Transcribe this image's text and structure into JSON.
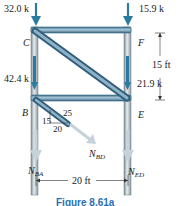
{
  "figure": {
    "caption": "Figure 8.61a",
    "joints": {
      "C": "C",
      "F": "F",
      "B": "B",
      "E": "E"
    },
    "loads": {
      "C_top": "32.0 k",
      "F_top": "15.9 k",
      "left_column": "42.4 k",
      "right_column": "21.9 k"
    },
    "reactions": {
      "N_BA": {
        "main": "N",
        "sub": "BA"
      },
      "N_BD": {
        "main": "N",
        "sub": "BD"
      },
      "N_ED": {
        "main": "N",
        "sub": "ED"
      }
    },
    "slope_triangle": {
      "vertical": "15",
      "horizontal": "20",
      "hypotenuse": "25"
    },
    "dimensions": {
      "height": "15 ft",
      "width": "20 ft"
    },
    "colors": {
      "member_fill": "#5b89a6",
      "member_edge": "#2f5e7c",
      "column_fill": "#9aa6ad",
      "load_arrow": "#2b7aa0",
      "reaction_arrow": "#c4d3da",
      "caption": "#2a6fb5"
    }
  }
}
